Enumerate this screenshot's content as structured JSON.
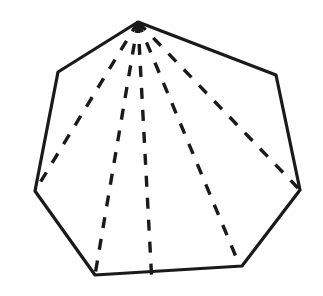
{
  "figure": {
    "title": "Heptagonal pyramid",
    "shape_type": "pyramid",
    "base_sides": 7,
    "background_color": "#ffffff",
    "stroke_color": "#1a1a1a",
    "fill_color": "none",
    "solid_stroke_width": 3.2,
    "dashed_stroke_width": 3.4,
    "dash_pattern": "11 11",
    "canvas": {
      "width": 323,
      "height": 296
    },
    "apex": {
      "name": "apex",
      "x": 138,
      "y": 22
    },
    "outline_vertices": [
      {
        "name": "apex",
        "x": 138,
        "y": 22
      },
      {
        "name": "upper-right",
        "x": 276,
        "y": 75
      },
      {
        "name": "right",
        "x": 300,
        "y": 190
      },
      {
        "name": "bottom-right",
        "x": 242,
        "y": 266
      },
      {
        "name": "bottom-left",
        "x": 95,
        "y": 275
      },
      {
        "name": "left",
        "x": 35,
        "y": 191
      },
      {
        "name": "upper-left",
        "x": 58,
        "y": 72
      }
    ],
    "outline_path": "M 138 22 L 276 75 L 300 190 L 242 266 L 95 275 L 35 191 L 58 72 Z",
    "hidden_edges": [
      {
        "name": "apex-to-left",
        "path": "M 138 22 L 35 191"
      },
      {
        "name": "apex-to-bottom-left",
        "path": "M 138 22 L 95 275"
      },
      {
        "name": "apex-to-base-center-front",
        "path": "M 138 22 L 152 284"
      },
      {
        "name": "apex-to-bottom-right",
        "path": "M 138 22 L 239 264"
      },
      {
        "name": "apex-to-right",
        "path": "M 138 22 L 298 188"
      }
    ],
    "hidden_edge_count": 5
  }
}
